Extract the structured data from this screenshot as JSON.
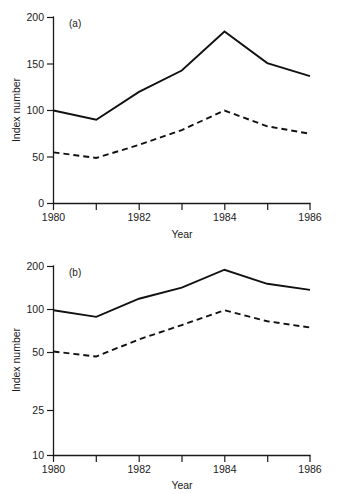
{
  "figure": {
    "width": 338,
    "height": 494,
    "background": "#ffffff",
    "ink_color": "#111111"
  },
  "chart_data": [
    {
      "type": "line",
      "panel": "(a)",
      "title": "",
      "xlabel": "Year",
      "ylabel": "Index number",
      "yscale": "linear",
      "xlim": [
        1980,
        1986
      ],
      "ylim": [
        0,
        200
      ],
      "yticks": [
        0,
        50,
        100,
        150,
        200
      ],
      "ytick_labels": [
        "0",
        "50",
        "100",
        "150",
        "200"
      ],
      "xticks": [
        1980,
        1981,
        1982,
        1983,
        1984,
        1985,
        1986
      ],
      "xtick_labels": [
        "1980",
        "",
        "1982",
        "",
        "1984",
        "",
        "1986"
      ],
      "grid": false,
      "legend": "none",
      "x": [
        1980,
        1981,
        1982,
        1983,
        1984,
        1985,
        1986
      ],
      "series": [
        {
          "name": "solid-series",
          "style": "solid",
          "values": [
            100,
            90,
            120,
            143,
            185,
            151,
            137
          ]
        },
        {
          "name": "dashed-series",
          "style": "dashed",
          "values": [
            55,
            49,
            63,
            79,
            100,
            83,
            75
          ]
        }
      ]
    },
    {
      "type": "line",
      "panel": "(b)",
      "title": "",
      "xlabel": "Year",
      "ylabel": "Index number",
      "yscale": "log",
      "xlim": [
        1980,
        1986
      ],
      "ylim": [
        10,
        200
      ],
      "yticks": [
        10,
        25,
        50,
        100,
        200
      ],
      "ytick_labels": [
        "10",
        "25",
        "50",
        "100",
        "200"
      ],
      "xticks": [
        1980,
        1981,
        1982,
        1983,
        1984,
        1985,
        1986
      ],
      "xtick_labels": [
        "1980",
        "",
        "1982",
        "",
        "1984",
        "",
        "1986"
      ],
      "grid": false,
      "legend": "none",
      "x": [
        1980,
        1981,
        1982,
        1983,
        1984,
        1985,
        1986
      ],
      "series": [
        {
          "name": "solid-series",
          "style": "solid",
          "values": [
            100,
            90,
            120,
            143,
            190,
            152,
            138
          ]
        },
        {
          "name": "dashed-series",
          "style": "dashed",
          "values": [
            52,
            48,
            63,
            79,
            100,
            84,
            76
          ]
        }
      ]
    }
  ],
  "panel_a": {
    "label": "(a)",
    "ylabel": "Index number",
    "xlabel": "Year",
    "ytick_labels": [
      "200",
      "150",
      "100",
      "50",
      "0"
    ],
    "xtick_labels": [
      "1980",
      "1982",
      "1984",
      "1986"
    ]
  },
  "panel_b": {
    "label": "(b)",
    "ylabel": "Index number",
    "xlabel": "Year",
    "ytick_labels": [
      "200",
      "100",
      "50",
      "25",
      "10"
    ],
    "xtick_labels": [
      "1980",
      "1982",
      "1984",
      "1986"
    ]
  }
}
